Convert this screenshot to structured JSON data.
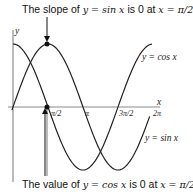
{
  "top_caption": {
    "text": "The slope of ",
    "expr": "y = sin x",
    "mid": " is 0 at ",
    "at": "x = π/2"
  },
  "bottom_caption": {
    "text": "The value of ",
    "expr": "y = cos x",
    "mid": " is 0 at ",
    "at": "x = π/2"
  },
  "axes": {
    "x_label": "x",
    "y_label": "y"
  },
  "ticks": [
    "π/2",
    "π",
    "3π/2",
    "2π"
  ],
  "curve_labels": {
    "cos": "y = cos x",
    "sin": "y = sin x"
  },
  "colors": {
    "curve": "#222222",
    "axis": "#777777",
    "point": "#111111"
  }
}
